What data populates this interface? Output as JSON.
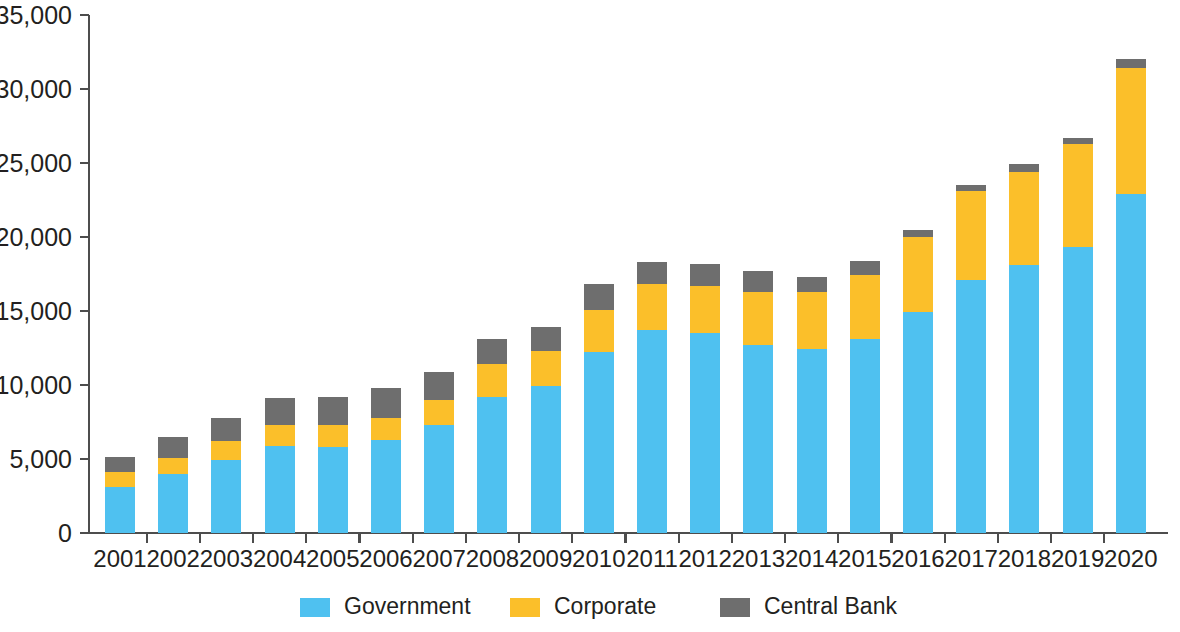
{
  "chart_data": {
    "type": "bar",
    "subtype": "stacked-bar",
    "title": "",
    "subtitle": "",
    "xlabel": "",
    "ylabel": "",
    "grid": false,
    "stacked": true,
    "legend_position": "bottom",
    "categories": [
      "2001",
      "2002",
      "2003",
      "2004",
      "2005",
      "2006",
      "2007",
      "2008",
      "2009",
      "2010",
      "2011",
      "2012",
      "2013",
      "2014",
      "2015",
      "2016",
      "2017",
      "2018",
      "2019",
      "2020"
    ],
    "ylim": [
      0,
      35000
    ],
    "y_ticks": [
      0,
      5000,
      10000,
      15000,
      20000,
      25000,
      30000,
      35000
    ],
    "y_tick_labels": [
      "0",
      "5,000",
      "10,000",
      "15,000",
      "20,000",
      "25,000",
      "30,000",
      "35,000"
    ],
    "series": [
      {
        "name": "Government",
        "color": "#4FC1F0",
        "values": [
          3100,
          4000,
          4900,
          5900,
          5800,
          6300,
          7300,
          9200,
          9900,
          12200,
          13700,
          13500,
          12700,
          12400,
          13100,
          14900,
          17100,
          18100,
          19300,
          22900
        ]
      },
      {
        "name": "Corporate",
        "color": "#FBBF2A",
        "values": [
          1000,
          1100,
          1300,
          1400,
          1500,
          1500,
          1700,
          2200,
          2400,
          2900,
          3100,
          3200,
          3600,
          3900,
          4300,
          5100,
          6000,
          6300,
          7000,
          8500
        ]
      },
      {
        "name": "Central Bank",
        "color": "#6E6E6E",
        "values": [
          1050,
          1400,
          1600,
          1800,
          1900,
          2000,
          1900,
          1700,
          1600,
          1700,
          1500,
          1500,
          1400,
          1000,
          1000,
          500,
          400,
          500,
          400,
          600
        ]
      }
    ],
    "totals": [
      5150,
      6500,
      7800,
      9100,
      9200,
      9800,
      10900,
      13100,
      13900,
      16800,
      18300,
      18200,
      17700,
      17300,
      18400,
      20500,
      23500,
      24900,
      26700,
      32000
    ]
  },
  "legend": {
    "items": [
      {
        "label": "Government",
        "color": "#4FC1F0"
      },
      {
        "label": "Corporate",
        "color": "#FBBF2A"
      },
      {
        "label": "Central Bank",
        "color": "#6E6E6E"
      }
    ]
  },
  "axes": {
    "y_axis_color": "#4d4d4d",
    "x_axis_color": "#4d4d4d"
  }
}
